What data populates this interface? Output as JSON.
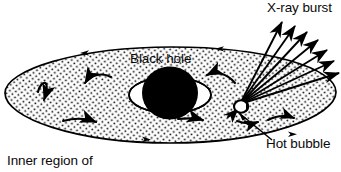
{
  "figure": {
    "kind": "astronomy-schematic-diagram",
    "title_text": "Inner region of",
    "labels": {
      "xray_burst": "X-ray burst",
      "black_hole": "Black hole",
      "hot_bubble": "Hot bubble",
      "inner_region": "Inner region of"
    },
    "colors": {
      "ink": "#000000",
      "background": "#ffffff",
      "disk_fill": "#ffffff",
      "disk_stipple": "#000000",
      "black_hole_fill": "#000000"
    },
    "elements": {
      "accretion_disk": {
        "name": "accretion-disk-ellipse",
        "center_x": 170,
        "center_y": 95,
        "radius_x": 165,
        "radius_y": 47,
        "texture": "stipple-dots",
        "edge_arrow_count": 4
      },
      "black_hole": {
        "name": "black-hole-sphere",
        "center_x": 170,
        "center_y": 93,
        "radius_x": 28,
        "radius_y": 26
      },
      "inner_gap_ring": {
        "name": "inner-gap-ellipse",
        "center_x": 170,
        "center_y": 95,
        "radius_x": 41,
        "radius_y": 18
      },
      "hot_bubble": {
        "name": "hot-bubble-blob",
        "center_x": 241,
        "center_y": 106,
        "radius_x": 7,
        "radius_y": 6
      },
      "xray_burst": {
        "name": "xray-burst-rays",
        "origin_x": 240,
        "origin_y": 104,
        "ray_count": 7
      },
      "rotation_arrows": {
        "name": "disk-rotation-arrows",
        "count": 8,
        "direction": "counter-clockwise-in-projection"
      },
      "leader_line": {
        "name": "hot-bubble-leader-line",
        "from_x": 272,
        "from_y": 140,
        "to_x": 238,
        "to_y": 114
      }
    }
  }
}
